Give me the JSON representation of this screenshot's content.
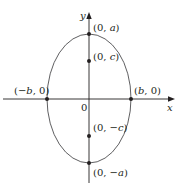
{
  "figure": {
    "colors": {
      "stroke": "#231f20",
      "curve": "#4d4d4f",
      "background": "#ffffff"
    },
    "geometry": {
      "center_px": [
        89,
        99
      ],
      "semi_axis_b_px": 42,
      "semi_axis_a_px": 64.5,
      "focal_c_px": 37.5
    },
    "axes": {
      "x_label": "x",
      "y_label": "y",
      "origin_label": "0"
    },
    "points": [
      {
        "id": "vertex-top",
        "label": "(0, a)",
        "label_parts": [
          "(0, ",
          "a",
          ")"
        ]
      },
      {
        "id": "focus-top",
        "label": "(0, c)",
        "label_parts": [
          "(0, ",
          "c",
          ")"
        ]
      },
      {
        "id": "covertex-left",
        "label": "(−b, 0)",
        "label_parts": [
          "(−",
          "b",
          ", 0)"
        ]
      },
      {
        "id": "covertex-right",
        "label": "(b, 0)",
        "label_parts": [
          "(",
          "b",
          ", 0)"
        ]
      },
      {
        "id": "focus-bottom",
        "label": "(0, −c)",
        "label_parts": [
          "(0, −",
          "c",
          ")"
        ]
      },
      {
        "id": "vertex-bottom",
        "label": "(0, −a)",
        "label_parts": [
          "(0, −",
          "a",
          ")"
        ]
      }
    ]
  }
}
